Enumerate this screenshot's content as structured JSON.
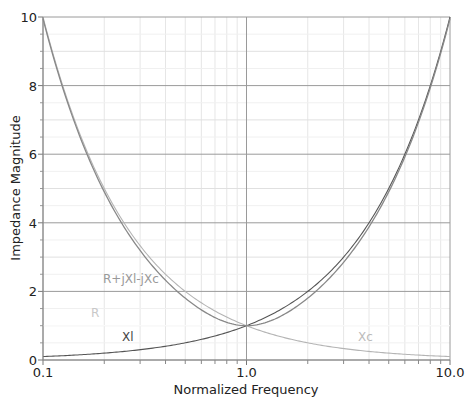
{
  "chart_data": {
    "type": "line",
    "title": "",
    "xlabel": "Normalized Frequency",
    "ylabel": "Impedance Magnitude",
    "xscale": "log",
    "xlim": [
      0.1,
      10.0
    ],
    "ylim": [
      0,
      10
    ],
    "x_ticks": [
      "0.1",
      "1.0",
      "10.0"
    ],
    "y_ticks": [
      "0",
      "2",
      "4",
      "6",
      "8",
      "10"
    ],
    "grid": true,
    "series": [
      {
        "name": "R",
        "label": "R",
        "color": "#ffffff",
        "label_color": "#c8c8c8",
        "formula": "1",
        "x": [
          0.1,
          0.2,
          0.5,
          1.0,
          2.0,
          5.0,
          10.0
        ],
        "values": [
          1,
          1,
          1,
          1,
          1,
          1,
          1
        ]
      },
      {
        "name": "Xl",
        "label": "Xl",
        "color": "#555555",
        "label_color": "#444444",
        "formula": "f",
        "x": [
          0.1,
          0.2,
          0.5,
          1.0,
          2.0,
          5.0,
          10.0
        ],
        "values": [
          0.1,
          0.2,
          0.5,
          1.0,
          2.0,
          5.0,
          10.0
        ]
      },
      {
        "name": "Xc",
        "label": "Xc",
        "color": "#b4b4b4",
        "label_color": "#bbbbbb",
        "formula": "1/f",
        "x": [
          0.1,
          0.2,
          0.5,
          1.0,
          2.0,
          5.0,
          10.0
        ],
        "values": [
          10.0,
          5.0,
          2.0,
          1.0,
          0.5,
          0.2,
          0.1
        ]
      },
      {
        "name": "R+jXl-jXc",
        "label": "R+jXl-jXc",
        "color": "#888888",
        "label_color": "#999999",
        "formula": "sqrt(1+(f-1/f)^2)",
        "x": [
          0.1,
          0.2,
          0.5,
          1.0,
          2.0,
          5.0,
          10.0
        ],
        "values": [
          9.95,
          4.9,
          1.8,
          1.0,
          1.8,
          4.9,
          9.95
        ]
      }
    ],
    "annotations": [
      {
        "text": "R+jXl-jXc",
        "x_px": 103,
        "y_px": 283
      },
      {
        "text": "R",
        "x_px": 91,
        "y_px": 317
      },
      {
        "text": "Xl",
        "x_px": 122,
        "y_px": 341
      },
      {
        "text": "Xc",
        "x_px": 358,
        "y_px": 341
      }
    ]
  }
}
